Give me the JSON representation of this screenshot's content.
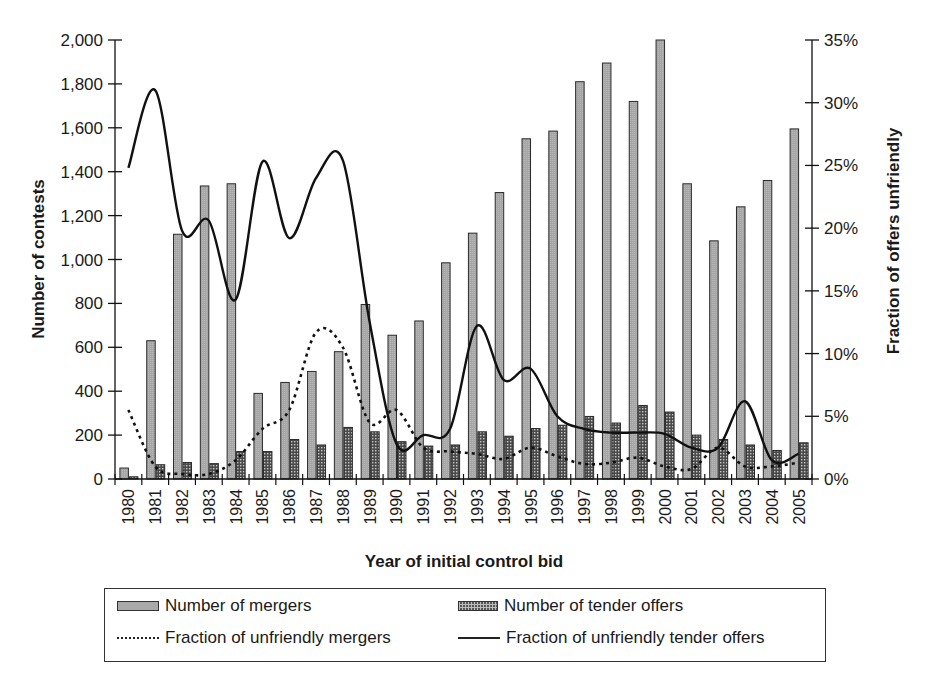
{
  "chart_data": {
    "type": "bar",
    "title": "",
    "xlabel": "Year of initial control bid",
    "ylabel": "Number of contests",
    "y2label": "Fraction of offers unfriendly",
    "ylim": [
      0,
      2000
    ],
    "y2lim": [
      0,
      0.35
    ],
    "yticks": [
      "0",
      "200",
      "400",
      "600",
      "800",
      "1,000",
      "1,200",
      "1,400",
      "1,600",
      "1,800",
      "2,000"
    ],
    "y2ticks": [
      "0%",
      "5%",
      "10%",
      "15%",
      "20%",
      "25%",
      "30%",
      "35%"
    ],
    "grid": false,
    "legend_position": "bottom (boxed, 2 columns)",
    "categories": [
      "1980",
      "1981",
      "1982",
      "1983",
      "1984",
      "1985",
      "1986",
      "1987",
      "1988",
      "1989",
      "1990",
      "1991",
      "1992",
      "1993",
      "1994",
      "1995",
      "1996",
      "1997",
      "1998",
      "1999",
      "2000",
      "2001",
      "2002",
      "2003",
      "2004",
      "2005"
    ],
    "series": [
      {
        "name": "Number of mergers",
        "type": "bar",
        "axis": "left",
        "values": [
          50,
          630,
          1115,
          1335,
          1345,
          390,
          440,
          490,
          580,
          795,
          655,
          720,
          985,
          1120,
          1305,
          1550,
          1585,
          1810,
          1895,
          1720,
          2000,
          1345,
          1085,
          1240,
          1360,
          1595
        ]
      },
      {
        "name": "Number of tender offers",
        "type": "bar",
        "axis": "left",
        "values": [
          10,
          65,
          75,
          70,
          125,
          125,
          180,
          155,
          235,
          215,
          170,
          150,
          155,
          215,
          195,
          230,
          245,
          285,
          255,
          335,
          305,
          200,
          180,
          155,
          130,
          165
        ]
      },
      {
        "name": "Fraction of unfriendly mergers",
        "type": "line",
        "style": "dashed",
        "axis": "right",
        "values": [
          0.055,
          0.01,
          0.004,
          0.004,
          0.015,
          0.04,
          0.055,
          0.117,
          0.105,
          0.045,
          0.055,
          0.025,
          0.022,
          0.02,
          0.016,
          0.025,
          0.018,
          0.012,
          0.013,
          0.017,
          0.01,
          0.008,
          0.025,
          0.01,
          0.01,
          0.013
        ]
      },
      {
        "name": "Fraction of unfriendly tender offers",
        "type": "line",
        "style": "solid",
        "axis": "right",
        "values": [
          0.248,
          0.31,
          0.198,
          0.206,
          0.143,
          0.253,
          0.192,
          0.24,
          0.254,
          0.125,
          0.028,
          0.035,
          0.04,
          0.122,
          0.079,
          0.088,
          0.05,
          0.04,
          0.037,
          0.037,
          0.036,
          0.025,
          0.025,
          0.062,
          0.015,
          0.02
        ]
      }
    ]
  },
  "legend": {
    "items": [
      {
        "label": "Number of mergers"
      },
      {
        "label": "Number of tender offers"
      },
      {
        "label": "Fraction of unfriendly mergers"
      },
      {
        "label": "Fraction of unfriendly tender offers"
      }
    ]
  },
  "colors": {
    "merger_bar": "#a9a9a9",
    "tender_bar": "#5a5a5a",
    "lines": "#1a1a1a"
  }
}
